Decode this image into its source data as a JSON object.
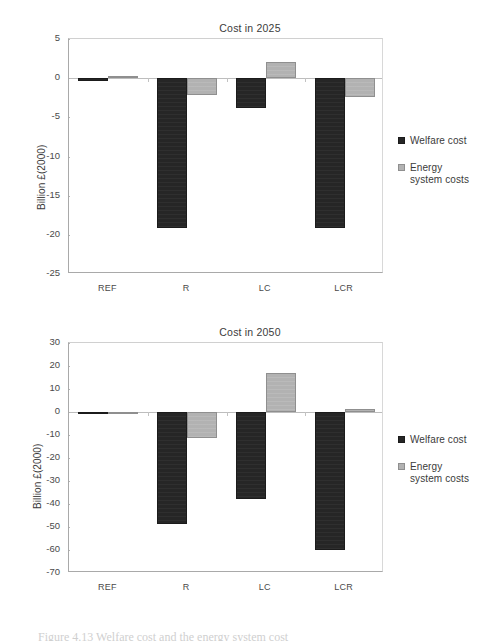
{
  "figure": {
    "caption_partial": "Figure 4.13 Welfare cost and the energy system cost"
  },
  "legend": {
    "items": [
      {
        "label": "Welfare cost",
        "color": "#262626",
        "swatch": "dark"
      },
      {
        "label": "Energy\nsystem costs",
        "color": "#b2b2b2",
        "swatch": "light"
      }
    ]
  },
  "chart_data": [
    {
      "id": "cost-2025",
      "type": "bar",
      "title": "Cost in 2025",
      "xlabel": "",
      "ylabel": "Billion £(2000)",
      "categories": [
        "REF",
        "R",
        "LC",
        "LCR"
      ],
      "ylim": [
        -25,
        5
      ],
      "yticks": [
        5,
        0,
        -5,
        -10,
        -15,
        -20,
        -25
      ],
      "ytick_labels": [
        "5",
        "0",
        "-5",
        "-10",
        "-15",
        "-20",
        "-25"
      ],
      "grid": false,
      "legend_position": "right",
      "series": [
        {
          "name": "Welfare cost",
          "color": "#262626",
          "values": [
            -0.4,
            -19.1,
            -3.8,
            -19.1
          ]
        },
        {
          "name": "Energy system costs",
          "color": "#b2b2b2",
          "values": [
            0.3,
            -2.1,
            2.1,
            -2.4
          ]
        }
      ]
    },
    {
      "id": "cost-2050",
      "type": "bar",
      "title": "Cost in 2050",
      "xlabel": "",
      "ylabel": "Billion £(2000)",
      "categories": [
        "REF",
        "R",
        "LC",
        "LCR"
      ],
      "ylim": [
        -70,
        30
      ],
      "yticks": [
        30,
        20,
        10,
        0,
        -10,
        -20,
        -30,
        -40,
        -50,
        -60,
        -70
      ],
      "ytick_labels": [
        "30",
        "20",
        "10",
        "0",
        "-10",
        "-20",
        "-30",
        "-40",
        "-50",
        "-60",
        "-70"
      ],
      "grid": false,
      "legend_position": "right",
      "series": [
        {
          "name": "Welfare cost",
          "color": "#262626",
          "values": [
            -0.6,
            -48.5,
            -38.0,
            -59.8
          ]
        },
        {
          "name": "Energy system costs",
          "color": "#b2b2b2",
          "values": [
            0.2,
            -11.2,
            17.0,
            1.2
          ]
        }
      ]
    }
  ]
}
